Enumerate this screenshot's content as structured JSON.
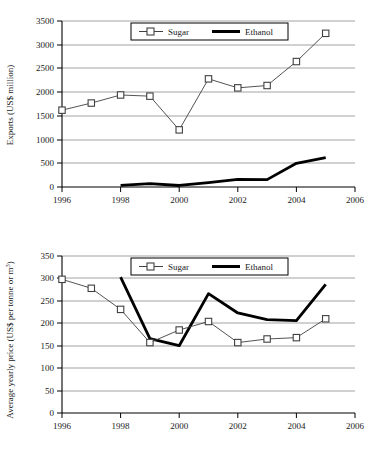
{
  "figure": {
    "background": "#ffffff",
    "axis_color": "#000000",
    "gridline_color": "#808080",
    "sugar_color": "#404040",
    "ethanol_color": "#000000"
  },
  "charts": [
    {
      "id": "chart-exports",
      "ylabel": "Exports (US$ million)",
      "xlabel": "",
      "legend": {
        "position": "top-center",
        "entries": [
          {
            "label": "Sugar",
            "marker": "open-square",
            "line": "thin"
          },
          {
            "label": "Ethanol",
            "marker": "none",
            "line": "thick"
          }
        ]
      },
      "yticks": [
        "0",
        "500",
        "1000",
        "1500",
        "2000",
        "2500",
        "3000",
        "3500"
      ],
      "xticks": [
        "1996",
        "1998",
        "2000",
        "2002",
        "2004",
        "2006"
      ]
    },
    {
      "id": "chart-price",
      "ylabel_pre": "Average yearly price (US$ per tonne or m",
      "ylabel_sup": "3",
      "ylabel_post": ")",
      "ylabel": "Average yearly price (US$ per tonne or m³)",
      "xlabel": "",
      "legend": {
        "position": "top-center",
        "entries": [
          {
            "label": "Sugar",
            "marker": "open-square",
            "line": "thin"
          },
          {
            "label": "Ethanol",
            "marker": "none",
            "line": "thick"
          }
        ]
      },
      "yticks": [
        "0",
        "50",
        "100",
        "150",
        "200",
        "250",
        "300",
        "350"
      ],
      "xticks": [
        "1996",
        "1998",
        "2000",
        "2002",
        "2004",
        "2006"
      ]
    }
  ],
  "chart_data": [
    {
      "type": "line",
      "title": "",
      "xlabel": "",
      "ylabel": "Exports (US$ million)",
      "x": [
        1996,
        1997,
        1998,
        1999,
        2000,
        2001,
        2002,
        2003,
        2004,
        2005
      ],
      "xlim": [
        1996,
        2006
      ],
      "ylim": [
        0,
        3500
      ],
      "xticks": [
        1996,
        1998,
        2000,
        2002,
        2004,
        2006
      ],
      "yticks": [
        0,
        500,
        1000,
        1500,
        2000,
        2500,
        3000,
        3500
      ],
      "grid": "horizontal",
      "legend": [
        "Sugar",
        "Ethanol"
      ],
      "legend_position": "top-center",
      "series": [
        {
          "name": "Sugar",
          "marker": "open-square",
          "x": [
            1996,
            1997,
            1998,
            1999,
            2000,
            2001,
            2002,
            2003,
            2004,
            2005
          ],
          "values": [
            1620,
            1770,
            1940,
            1915,
            1205,
            2280,
            2090,
            2140,
            2645,
            3240
          ]
        },
        {
          "name": "Ethanol",
          "marker": "none",
          "x": [
            1998,
            1999,
            2000,
            2001,
            2002,
            2003,
            2004,
            2005
          ],
          "values": [
            35,
            72,
            32,
            92,
            160,
            155,
            500,
            620
          ]
        }
      ]
    },
    {
      "type": "line",
      "title": "",
      "xlabel": "",
      "ylabel": "Average yearly price (US$ per tonne or m³)",
      "x": [
        1996,
        1997,
        1998,
        1999,
        2000,
        2001,
        2002,
        2003,
        2004,
        2005
      ],
      "xlim": [
        1996,
        2006
      ],
      "ylim": [
        0,
        350
      ],
      "xticks": [
        1996,
        1998,
        2000,
        2002,
        2004,
        2006
      ],
      "yticks": [
        0,
        50,
        100,
        150,
        200,
        250,
        300,
        350
      ],
      "grid": "horizontal",
      "legend": [
        "Sugar",
        "Ethanol"
      ],
      "legend_position": "top-center",
      "series": [
        {
          "name": "Sugar",
          "marker": "open-square",
          "x": [
            1996,
            1997,
            1998,
            1999,
            2000,
            2001,
            2002,
            2003,
            2004,
            2005
          ],
          "values": [
            298,
            278,
            231,
            157,
            185,
            204,
            157,
            165,
            168,
            210
          ]
        },
        {
          "name": "Ethanol",
          "marker": "none",
          "x": [
            1998,
            1999,
            2000,
            2001,
            2002,
            2003,
            2004,
            2005
          ],
          "values": [
            303,
            166,
            150,
            266,
            223,
            208,
            206,
            287
          ]
        }
      ]
    }
  ]
}
